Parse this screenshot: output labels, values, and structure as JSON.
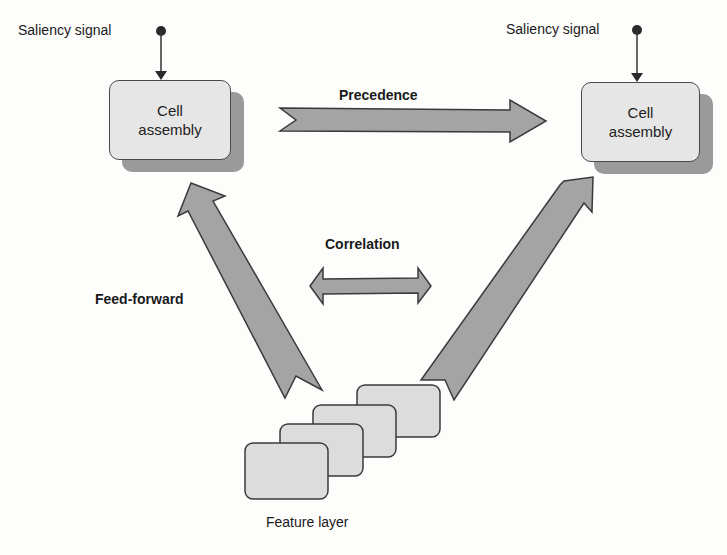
{
  "diagram": {
    "colors": {
      "background": "#fdfdfc",
      "arrow_fill": "#a4a4a4",
      "arrow_stroke": "#3a3a3a",
      "box_fill": "#e6e6e6",
      "box_shadow": "#9a9a9a",
      "layer_fill": "#dcdcdc",
      "text": "#1a1a1a"
    },
    "saliency_left": {
      "label": "Saliency signal"
    },
    "saliency_right": {
      "label": "Saliency signal"
    },
    "cell_left": {
      "line1": "Cell",
      "line2": "assembly"
    },
    "cell_right": {
      "line1": "Cell",
      "line2": "assembly"
    },
    "precedence": {
      "label": "Precedence"
    },
    "correlation": {
      "label": "Correlation"
    },
    "feed_forward": {
      "label": "Feed-forward"
    },
    "feature_layer": {
      "label": "Feature layer",
      "layer_count": 4
    }
  }
}
